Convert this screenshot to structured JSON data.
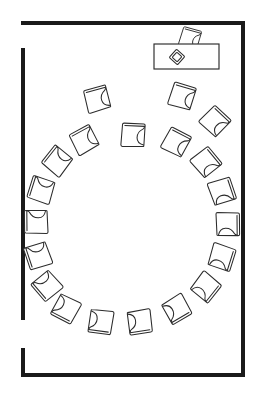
{
  "document": {
    "kind": "floor-plan",
    "title": "Seating Layout Floor Plan",
    "description": "Rectangular room with a circular arrangement of chairs and a presenter table at the upper right.",
    "background_color": "#ffffff",
    "line_color": "#2b2b2b",
    "wall_color": "#1a1a1a"
  },
  "canvas": {
    "width": 263,
    "height": 400
  },
  "room": {
    "name": "room-outline",
    "wall_thickness": 4,
    "bounds": {
      "left": 21,
      "top": 21,
      "right": 245,
      "bottom": 377
    },
    "walls": [
      {
        "name": "wall-top",
        "x": 21,
        "y": 21,
        "width": 224,
        "height": 4,
        "orientation": "horizontal"
      },
      {
        "name": "wall-right",
        "x": 241,
        "y": 21,
        "width": 4,
        "height": 356,
        "orientation": "vertical"
      },
      {
        "name": "wall-bottom",
        "x": 21,
        "y": 373,
        "width": 224,
        "height": 4,
        "orientation": "horizontal"
      },
      {
        "name": "wall-left-upper",
        "x": 21,
        "y": 48,
        "width": 4,
        "height": 272,
        "orientation": "vertical"
      },
      {
        "name": "wall-left-lower",
        "x": 21,
        "y": 348,
        "width": 4,
        "height": 29,
        "orientation": "vertical"
      }
    ],
    "openings": [
      {
        "name": "doorway-left-top",
        "x": 21,
        "y": 25,
        "width": 4,
        "height": 23
      },
      {
        "name": "doorway-left-bottom",
        "x": 21,
        "y": 320,
        "width": 4,
        "height": 28
      }
    ]
  },
  "table": {
    "name": "presenter-table",
    "label": "table",
    "x": 154,
    "y": 44,
    "width": 65,
    "height": 25,
    "items": [
      {
        "name": "tabletop-object",
        "label": "object-on-table",
        "cx": 177,
        "cy": 57,
        "size": 11,
        "rotation": 42
      }
    ],
    "chair": {
      "name": "presenter-chair",
      "cx": 190,
      "cy": 38,
      "size": 18,
      "rotation": 196
    }
  },
  "chair_circle": {
    "name": "chair-ring",
    "label": "chairs arranged in a circle",
    "count": 20,
    "center": {
      "x": 133,
      "y": 225
    },
    "radius_x": 86,
    "radius_y": 98,
    "chair_size": 22,
    "chairs": [
      {
        "id": 1,
        "cx": 133,
        "cy": 135,
        "rotation": 183
      },
      {
        "id": 2,
        "cx": 176,
        "cy": 142,
        "rotation": 208
      },
      {
        "id": 3,
        "cx": 206,
        "cy": 162,
        "rotation": 231
      },
      {
        "id": 4,
        "cx": 222,
        "cy": 191,
        "rotation": 252
      },
      {
        "id": 5,
        "cx": 228,
        "cy": 224,
        "rotation": 270
      },
      {
        "id": 6,
        "cx": 222,
        "cy": 257,
        "rotation": 288
      },
      {
        "id": 7,
        "cx": 206,
        "cy": 287,
        "rotation": 309
      },
      {
        "id": 8,
        "cx": 177,
        "cy": 309,
        "rotation": 330
      },
      {
        "id": 9,
        "cx": 140,
        "cy": 322,
        "rotation": 352
      },
      {
        "id": 10,
        "cx": 101,
        "cy": 322,
        "rotation": 8
      },
      {
        "id": 11,
        "cx": 66,
        "cy": 309,
        "rotation": 28
      },
      {
        "id": 12,
        "cx": 47,
        "cy": 286,
        "rotation": 50
      },
      {
        "id": 13,
        "cx": 38,
        "cy": 256,
        "rotation": 72
      },
      {
        "id": 14,
        "cx": 36,
        "cy": 222,
        "rotation": 90
      },
      {
        "id": 15,
        "cx": 41,
        "cy": 190,
        "rotation": 108
      },
      {
        "id": 16,
        "cx": 57,
        "cy": 161,
        "rotation": 129
      },
      {
        "id": 17,
        "cx": 84,
        "cy": 140,
        "rotation": 152
      },
      {
        "id": 18,
        "cx": 182,
        "cy": 96,
        "rotation": 197
      },
      {
        "id": 19,
        "cx": 215,
        "cy": 121,
        "rotation": 224
      },
      {
        "id": 20,
        "cx": 97,
        "cy": 99,
        "rotation": 165
      }
    ]
  },
  "legend": {
    "chair_label": "chair",
    "table_label": "table",
    "door_label": "doorway"
  }
}
